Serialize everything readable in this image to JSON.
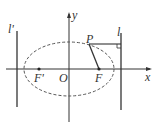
{
  "diagram": {
    "type": "ellipse-focus-directrix",
    "labels": {
      "y_axis": "y",
      "x_axis": "x",
      "origin": "O",
      "left_focus": "F'",
      "right_focus": "F",
      "point": "P",
      "left_directrix": "l'",
      "right_directrix": "l"
    },
    "colors": {
      "stroke": "#333333",
      "dashed": "#555555",
      "background": "#ffffff"
    }
  }
}
